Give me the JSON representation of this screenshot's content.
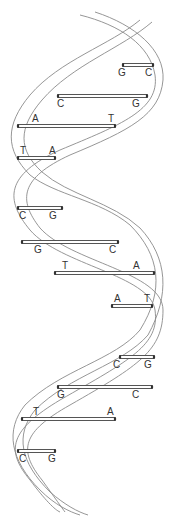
{
  "diagram": {
    "colors": {
      "strand": "#8a8a8a",
      "rung": "#444444",
      "label": "#333333",
      "background": "#ffffff"
    },
    "base_pairs": [
      {
        "left": "G",
        "right": "C",
        "y": 65,
        "x1": 123,
        "x2": 153,
        "lx": 118,
        "rx": 145
      },
      {
        "left": "C",
        "right": "G",
        "y": 96,
        "x1": 58,
        "x2": 147,
        "lx": 57,
        "rx": 132
      },
      {
        "left": "A",
        "right": "T",
        "y": 126,
        "x1": 18,
        "x2": 115,
        "lx": 32,
        "rx": 108
      },
      {
        "left": "T",
        "right": "A",
        "y": 158,
        "x1": 18,
        "x2": 55,
        "lx": 20,
        "rx": 49
      },
      {
        "left": "C",
        "right": "G",
        "y": 208,
        "x1": 18,
        "x2": 62,
        "lx": 19,
        "rx": 49
      },
      {
        "left": "G",
        "right": "C",
        "y": 242,
        "x1": 22,
        "x2": 118,
        "lx": 34,
        "rx": 109
      },
      {
        "left": "T",
        "right": "A",
        "y": 273,
        "x1": 55,
        "x2": 154,
        "lx": 62,
        "rx": 133
      },
      {
        "left": "A",
        "right": "T",
        "y": 306,
        "x1": 112,
        "x2": 152,
        "lx": 114,
        "rx": 144
      },
      {
        "left": "C",
        "right": "G",
        "y": 357,
        "x1": 120,
        "x2": 154,
        "lx": 113,
        "rx": 144
      },
      {
        "left": "G",
        "right": "C",
        "y": 387,
        "x1": 58,
        "x2": 152,
        "lx": 57,
        "rx": 132
      },
      {
        "left": "T",
        "right": "A",
        "y": 419,
        "x1": 22,
        "x2": 115,
        "lx": 33,
        "rx": 107
      },
      {
        "left": "C",
        "right": "G",
        "y": 451,
        "x1": 18,
        "x2": 55,
        "lx": 19,
        "rx": 48
      }
    ]
  }
}
